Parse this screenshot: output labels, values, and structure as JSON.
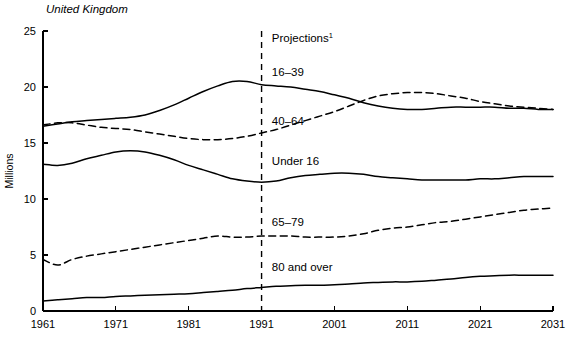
{
  "region_title": "United Kingdom",
  "chart_data": {
    "type": "line",
    "title": "United Kingdom",
    "xlabel": "",
    "ylabel": "Millions",
    "xlim": [
      1961,
      2031
    ],
    "ylim": [
      0,
      25
    ],
    "xticks": [
      1961,
      1971,
      1981,
      1991,
      2001,
      2011,
      2021,
      2031
    ],
    "yticks": [
      0,
      5,
      10,
      15,
      20,
      25
    ],
    "grid": false,
    "legend": "inline-labels",
    "annotations": [
      {
        "text": "Projections",
        "superscript": "1",
        "x": 1992,
        "y": 24.0
      },
      {
        "text": "16–39",
        "x": 1992,
        "y": 21.0
      },
      {
        "text": "40–64",
        "x": 1992,
        "y": 16.6
      },
      {
        "text": "Under 16",
        "x": 1992,
        "y": 13.0
      },
      {
        "text": "65–79",
        "x": 1992,
        "y": 7.6
      },
      {
        "text": "80 and over",
        "x": 1992,
        "y": 3.6
      }
    ],
    "projection_divider_x": 1991,
    "x": [
      1961,
      1963,
      1965,
      1967,
      1969,
      1971,
      1973,
      1975,
      1977,
      1979,
      1981,
      1983,
      1985,
      1987,
      1989,
      1991,
      1993,
      1995,
      1997,
      1999,
      2001,
      2003,
      2005,
      2007,
      2009,
      2011,
      2013,
      2015,
      2017,
      2019,
      2021,
      2023,
      2025,
      2027,
      2029,
      2031
    ],
    "series": [
      {
        "name": "16–39",
        "style": "solid",
        "values": [
          16.5,
          16.7,
          16.9,
          17.0,
          17.1,
          17.2,
          17.3,
          17.5,
          17.9,
          18.4,
          19.0,
          19.6,
          20.1,
          20.5,
          20.5,
          20.2,
          20.1,
          20.0,
          19.8,
          19.6,
          19.3,
          19.0,
          18.6,
          18.3,
          18.1,
          18.0,
          18.0,
          18.1,
          18.2,
          18.2,
          18.2,
          18.2,
          18.1,
          18.1,
          18.0,
          18.0
        ]
      },
      {
        "name": "40–64",
        "style": "dashed",
        "values": [
          16.6,
          16.8,
          16.8,
          16.6,
          16.4,
          16.3,
          16.2,
          16.0,
          15.8,
          15.6,
          15.4,
          15.3,
          15.3,
          15.4,
          15.6,
          15.9,
          16.2,
          16.6,
          17.0,
          17.4,
          17.8,
          18.3,
          18.8,
          19.2,
          19.4,
          19.5,
          19.5,
          19.4,
          19.2,
          19.0,
          18.7,
          18.5,
          18.3,
          18.2,
          18.1,
          18.0
        ]
      },
      {
        "name": "Under 16",
        "style": "solid",
        "values": [
          13.1,
          13.0,
          13.2,
          13.6,
          13.9,
          14.2,
          14.3,
          14.2,
          13.9,
          13.5,
          13.0,
          12.6,
          12.2,
          11.8,
          11.6,
          11.5,
          11.6,
          11.9,
          12.1,
          12.2,
          12.3,
          12.3,
          12.2,
          12.0,
          11.9,
          11.8,
          11.7,
          11.7,
          11.7,
          11.7,
          11.8,
          11.8,
          11.9,
          12.0,
          12.0,
          12.0
        ]
      },
      {
        "name": "65–79",
        "style": "dashed",
        "values": [
          4.6,
          4.1,
          4.6,
          4.9,
          5.1,
          5.3,
          5.5,
          5.7,
          5.9,
          6.1,
          6.3,
          6.5,
          6.7,
          6.6,
          6.6,
          6.7,
          6.7,
          6.7,
          6.6,
          6.6,
          6.6,
          6.7,
          6.9,
          7.2,
          7.4,
          7.5,
          7.7,
          7.9,
          8.0,
          8.2,
          8.4,
          8.6,
          8.8,
          9.0,
          9.1,
          9.2
        ]
      },
      {
        "name": "80 and over",
        "style": "solid",
        "values": [
          0.9,
          1.0,
          1.1,
          1.2,
          1.2,
          1.3,
          1.35,
          1.4,
          1.45,
          1.5,
          1.55,
          1.65,
          1.75,
          1.85,
          2.0,
          2.1,
          2.2,
          2.25,
          2.3,
          2.3,
          2.35,
          2.4,
          2.5,
          2.55,
          2.6,
          2.6,
          2.65,
          2.75,
          2.85,
          3.0,
          3.1,
          3.15,
          3.2,
          3.2,
          3.2,
          3.2
        ]
      }
    ]
  }
}
